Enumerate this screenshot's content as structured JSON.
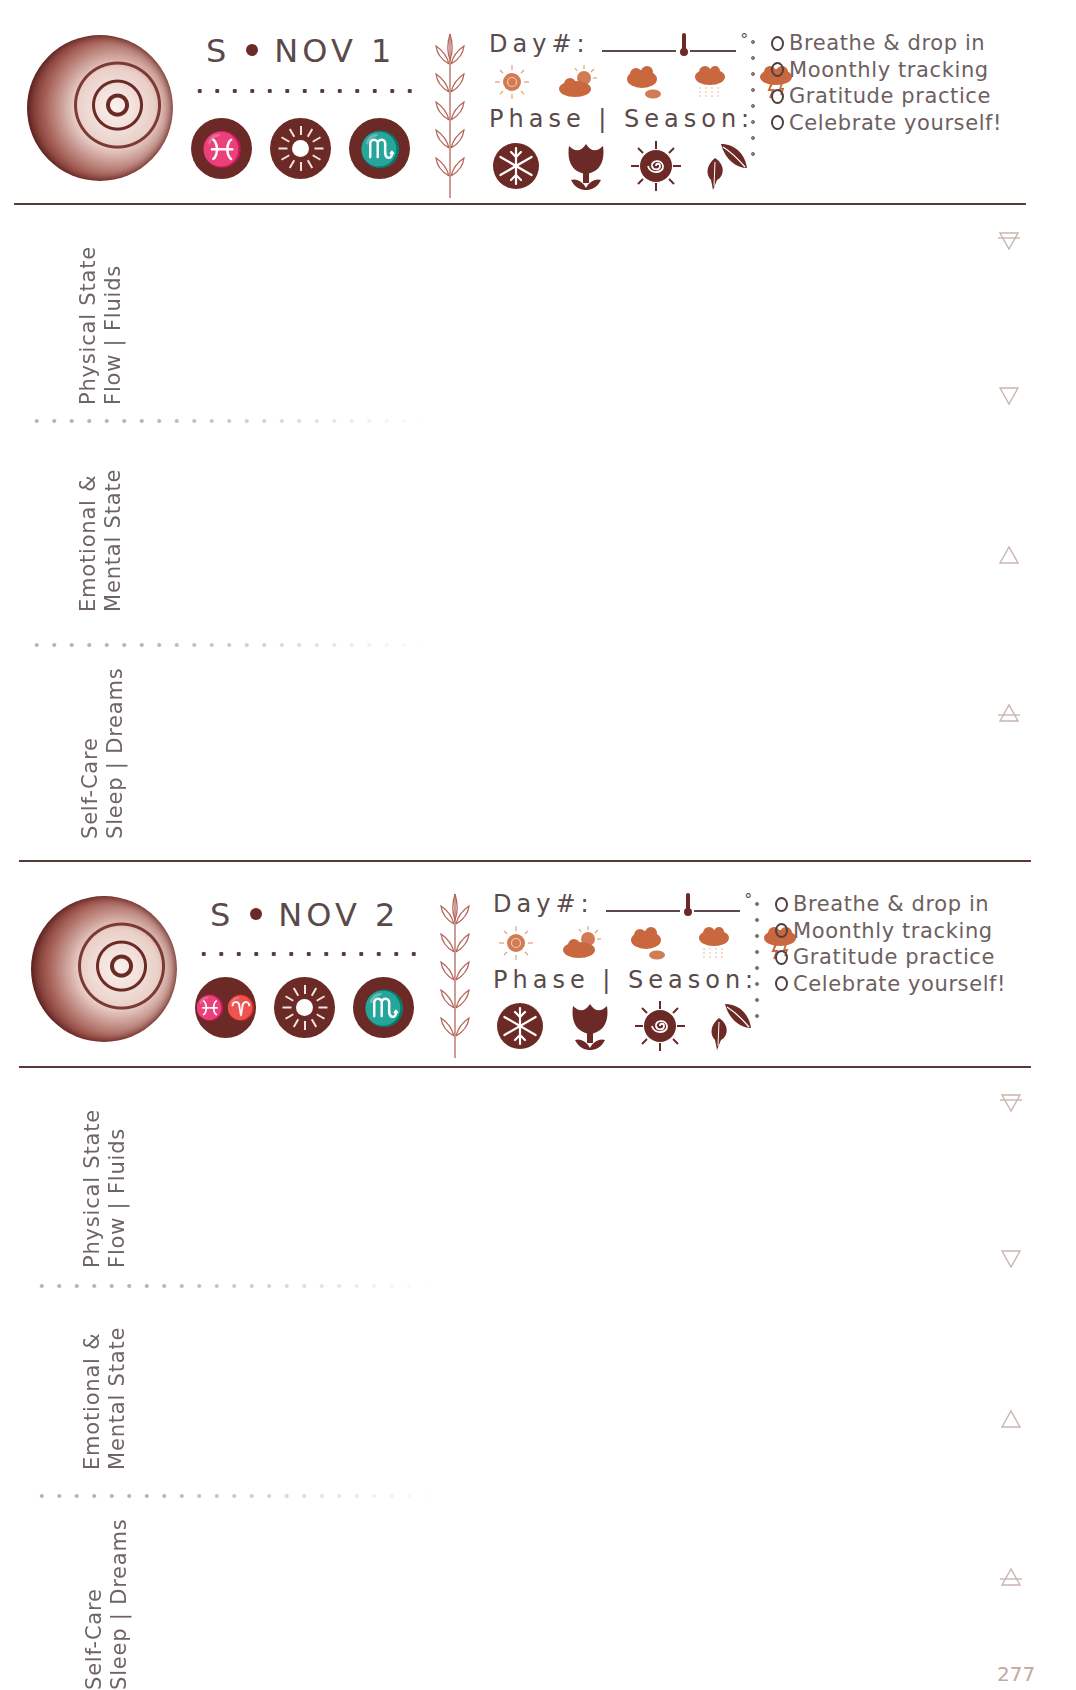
{
  "page_number": "277",
  "colors": {
    "ink": "#6b2a26",
    "weather": "#d27c55",
    "text": "#5a4a4a",
    "element_symbols": "#c9b5ae"
  },
  "days": [
    {
      "date_prefix": "S",
      "date_label": "NOV 1",
      "zodiac": [
        {
          "icon": "pisces-icon",
          "glyph": "♓"
        },
        {
          "icon": "sun-icon",
          "glyph": ""
        },
        {
          "icon": "scorpio-icon",
          "glyph": "♏"
        }
      ],
      "day_label": "Day#:",
      "degree_symbol": "°",
      "weather_icons": [
        "sunny-icon",
        "partly-cloudy-icon",
        "cloudy-icon",
        "rain-icon",
        "storm-icon"
      ],
      "phase_label": "Phase | Season:",
      "season_icons": [
        "winter-snowflake-icon",
        "spring-tulip-icon",
        "summer-sun-spiral-icon",
        "autumn-leaves-icon"
      ],
      "checklist": [
        "Breathe & drop in",
        "Moonthly tracking",
        "Gratitude practice",
        "Celebrate yourself!"
      ],
      "sections": [
        {
          "line1": "Physical State",
          "line2": "Flow | Fluids",
          "element": "earth-icon"
        },
        {
          "line1": "Emotional &",
          "line2": "Mental State",
          "element": "water-icon"
        },
        {
          "line1": "Self-Care",
          "line2": "Sleep | Dreams",
          "element": "fire-icon"
        }
      ],
      "element_symbols": [
        "earth-icon",
        "water-icon",
        "fire-icon",
        "air-icon"
      ]
    },
    {
      "date_prefix": "S",
      "date_label": "NOV 2",
      "zodiac": [
        {
          "icon": "pisces-aries-icon",
          "glyph": "♓♈"
        },
        {
          "icon": "sun-icon",
          "glyph": ""
        },
        {
          "icon": "scorpio-icon",
          "glyph": "♏"
        }
      ],
      "day_label": "Day#:",
      "degree_symbol": "°",
      "weather_icons": [
        "sunny-icon",
        "partly-cloudy-icon",
        "cloudy-icon",
        "rain-icon",
        "storm-icon"
      ],
      "phase_label": "Phase | Season:",
      "season_icons": [
        "winter-snowflake-icon",
        "spring-tulip-icon",
        "summer-sun-spiral-icon",
        "autumn-leaves-icon"
      ],
      "checklist": [
        "Breathe & drop in",
        "Moonthly tracking",
        "Gratitude practice",
        "Celebrate yourself!"
      ],
      "sections": [
        {
          "line1": "Physical State",
          "line2": "Flow | Fluids",
          "element": "earth-icon"
        },
        {
          "line1": "Emotional &",
          "line2": "Mental State",
          "element": "water-icon"
        },
        {
          "line1": "Self-Care",
          "line2": "Sleep | Dreams",
          "element": "fire-icon"
        }
      ],
      "element_symbols": [
        "earth-icon",
        "water-icon",
        "fire-icon",
        "air-icon"
      ]
    }
  ]
}
